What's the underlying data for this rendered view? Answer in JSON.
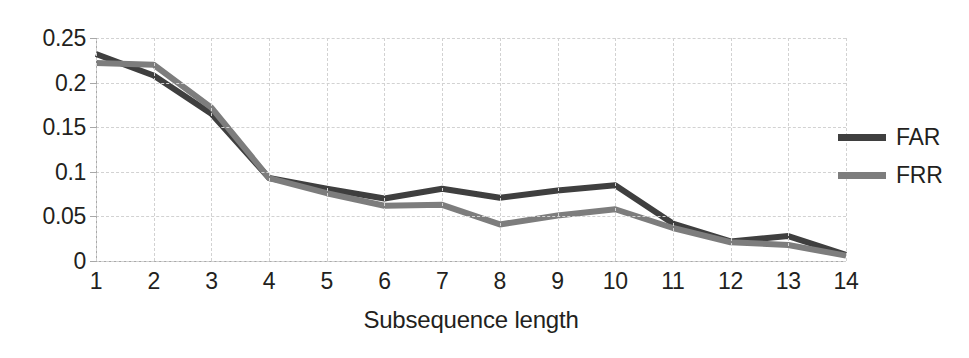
{
  "chart_data": {
    "type": "line",
    "title": "",
    "xlabel": "Subsequence length",
    "ylabel": "",
    "x": [
      1,
      2,
      3,
      4,
      5,
      6,
      7,
      8,
      9,
      10,
      11,
      12,
      13,
      14
    ],
    "categories": [
      "1",
      "2",
      "3",
      "4",
      "5",
      "6",
      "7",
      "8",
      "9",
      "10",
      "11",
      "12",
      "13",
      "14"
    ],
    "series": [
      {
        "name": "FAR",
        "color": "#3f3f3f",
        "values": [
          0.232,
          0.208,
          0.165,
          0.093,
          0.081,
          0.07,
          0.081,
          0.071,
          0.079,
          0.085,
          0.042,
          0.022,
          0.028,
          0.007
        ]
      },
      {
        "name": "FRR",
        "color": "#7d7d7d",
        "values": [
          0.222,
          0.22,
          0.172,
          0.093,
          0.076,
          0.062,
          0.063,
          0.041,
          0.051,
          0.058,
          0.037,
          0.021,
          0.018,
          0.006
        ]
      }
    ],
    "ylim": [
      0,
      0.25
    ],
    "xlim": [
      1,
      14
    ],
    "yticks": [
      0,
      0.05,
      0.1,
      0.15,
      0.2,
      0.25
    ],
    "ytick_labels": [
      "0",
      "0.05",
      "0.1",
      "0.15",
      "0.2",
      "0.25"
    ],
    "grid": true,
    "legend_position": "right"
  },
  "legend": {
    "entries": [
      {
        "label": "FAR",
        "color": "#3f3f3f"
      },
      {
        "label": "FRR",
        "color": "#7d7d7d"
      }
    ]
  },
  "axis": {
    "x_title": "Subsequence length"
  }
}
